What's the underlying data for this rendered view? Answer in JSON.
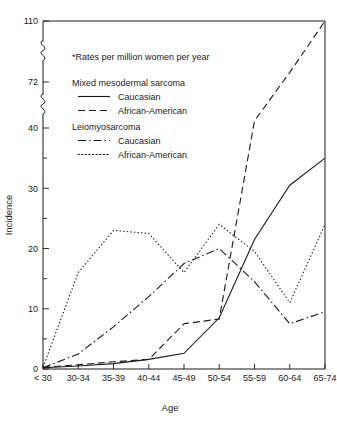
{
  "chart_data": {
    "type": "line",
    "title": "",
    "note": "*Rates per million women per year",
    "xlabel": "Age",
    "ylabel": "Incidence",
    "categories": [
      "< 30",
      "30-34",
      "35-39",
      "40-44",
      "45-49",
      "50-54",
      "55-59",
      "60-64",
      "65-74"
    ],
    "xtick_labels": [
      "< 30",
      "30-34",
      "35-39",
      "40-44",
      "45-49",
      "50-54",
      "55-59",
      "60-64",
      "65-74"
    ],
    "ytick_labels": [
      "0",
      "10",
      "20",
      "30",
      "40",
      "72",
      "110"
    ],
    "ytick_values": [
      0,
      10,
      20,
      30,
      40,
      72,
      110
    ],
    "yminor_values": [
      5,
      15,
      25,
      35
    ],
    "ylim": [
      0,
      110
    ],
    "grid": false,
    "axis_breaks": [
      [
        40,
        72
      ],
      [
        72,
        110
      ]
    ],
    "legend_position": "upper-left-inside",
    "legend_groups": [
      {
        "group_label": "Mixed mesodermal sarcoma",
        "entries": [
          {
            "name": "Caucasian",
            "style": "solid"
          },
          {
            "name": "African-American",
            "style": "dashed"
          }
        ]
      },
      {
        "group_label": "Leiomyosarcoma",
        "entries": [
          {
            "name": "Caucasian",
            "style": "dash-dot"
          },
          {
            "name": "African-American",
            "style": "dotted"
          }
        ]
      }
    ],
    "series": [
      {
        "name": "Mixed mesodermal sarcoma - Caucasian",
        "style": "solid",
        "values": [
          0.2,
          0.5,
          0.9,
          1.6,
          2.6,
          8.5,
          21.5,
          30.5,
          35.0
        ]
      },
      {
        "name": "Mixed mesodermal sarcoma - African-American",
        "style": "dashed",
        "values": [
          0.3,
          0.7,
          1.2,
          1.6,
          7.5,
          8.3,
          45.0,
          78.0,
          110.0
        ]
      },
      {
        "name": "Leiomyosarcoma - Caucasian",
        "style": "dash-dot",
        "values": [
          0.2,
          2.5,
          7.0,
          12.0,
          17.5,
          20.0,
          14.5,
          7.5,
          9.5
        ]
      },
      {
        "name": "Leiomyosarcoma - African-American",
        "style": "dotted",
        "values": [
          0.3,
          16.0,
          23.0,
          22.5,
          16.0,
          24.0,
          19.5,
          11.0,
          24.0
        ]
      }
    ]
  }
}
